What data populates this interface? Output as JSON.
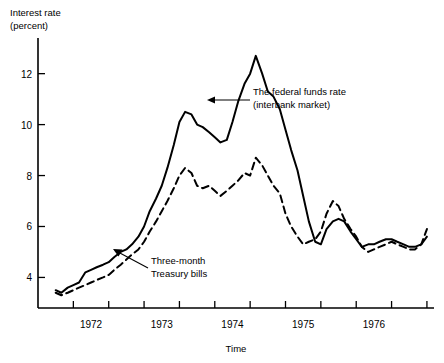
{
  "chart_data": {
    "type": "line",
    "title": "",
    "ylabel": "Interest rate (percent)",
    "ylabel_line1": "Interest rate",
    "ylabel_line2": "(percent)",
    "xlabel": "Time",
    "ylim": [
      2.8,
      13.4
    ],
    "xlim": [
      1971.5,
      1977.1
    ],
    "ytick_labels": [
      "4",
      "6",
      "8",
      "10",
      "12"
    ],
    "yticks": [
      4,
      6,
      8,
      10,
      12
    ],
    "xtick_labels": [
      "1972",
      "1973",
      "1974",
      "1975",
      "1976"
    ],
    "xticks": [
      1972.0,
      1972.5,
      1973.0,
      1973.5,
      1974.0,
      1974.5,
      1975.0,
      1975.5,
      1976.0,
      1976.5,
      1977.0
    ],
    "grid": false,
    "legend_position": "inline-annotations",
    "annotations": [
      {
        "name": "federal-funds-annotation",
        "line1": "The federal funds rate",
        "line2": "(interbank market)",
        "arrow": "left"
      },
      {
        "name": "treasury-bills-annotation",
        "line1": "Three-month",
        "line2": "Treasury bills",
        "arrow": "upper-left"
      }
    ],
    "series": [
      {
        "name": "The federal funds rate (interbank market)",
        "style": "solid",
        "color": "#000000",
        "x": [
          1971.75,
          1971.83,
          1971.92,
          1972.0,
          1972.08,
          1972.17,
          1972.25,
          1972.33,
          1972.42,
          1972.5,
          1972.58,
          1972.67,
          1972.75,
          1972.83,
          1972.92,
          1973.0,
          1973.08,
          1973.17,
          1973.25,
          1973.33,
          1973.42,
          1973.5,
          1973.58,
          1973.67,
          1973.75,
          1973.83,
          1973.92,
          1974.0,
          1974.08,
          1974.17,
          1974.25,
          1974.33,
          1974.42,
          1974.5,
          1974.58,
          1974.67,
          1974.75,
          1974.83,
          1974.92,
          1975.0,
          1975.08,
          1975.17,
          1975.25,
          1975.33,
          1975.42,
          1975.5,
          1975.58,
          1975.67,
          1975.75,
          1975.83,
          1975.92,
          1976.0,
          1976.08,
          1976.17,
          1976.25,
          1976.33,
          1976.42,
          1976.5,
          1976.58,
          1976.67,
          1976.75,
          1976.83,
          1976.92,
          1977.0
        ],
        "y": [
          3.5,
          3.4,
          3.6,
          3.7,
          3.8,
          4.2,
          4.3,
          4.4,
          4.5,
          4.6,
          4.8,
          5.0,
          5.1,
          5.3,
          5.6,
          6.0,
          6.6,
          7.1,
          7.6,
          8.3,
          9.2,
          10.1,
          10.5,
          10.4,
          10.0,
          9.9,
          9.7,
          9.5,
          9.3,
          9.4,
          10.1,
          10.9,
          11.6,
          12.0,
          12.7,
          12.0,
          11.3,
          11.1,
          10.6,
          9.8,
          9.0,
          8.2,
          7.2,
          6.2,
          5.4,
          5.3,
          5.9,
          6.2,
          6.3,
          6.2,
          5.8,
          5.5,
          5.2,
          5.3,
          5.3,
          5.4,
          5.5,
          5.5,
          5.4,
          5.3,
          5.2,
          5.2,
          5.3,
          5.6
        ]
      },
      {
        "name": "Three-month Treasury bills",
        "style": "dashed",
        "color": "#000000",
        "x": [
          1971.75,
          1971.83,
          1971.92,
          1972.0,
          1972.08,
          1972.17,
          1972.25,
          1972.33,
          1972.42,
          1972.5,
          1972.58,
          1972.67,
          1972.75,
          1972.83,
          1972.92,
          1973.0,
          1973.08,
          1973.17,
          1973.25,
          1973.33,
          1973.42,
          1973.5,
          1973.58,
          1973.67,
          1973.75,
          1973.83,
          1973.92,
          1974.0,
          1974.08,
          1974.17,
          1974.25,
          1974.33,
          1974.42,
          1974.5,
          1974.58,
          1974.67,
          1974.75,
          1974.83,
          1974.92,
          1975.0,
          1975.08,
          1975.17,
          1975.25,
          1975.33,
          1975.42,
          1975.5,
          1975.58,
          1975.67,
          1975.75,
          1975.83,
          1975.92,
          1976.0,
          1976.08,
          1976.17,
          1976.25,
          1976.33,
          1976.42,
          1976.5,
          1976.58,
          1976.67,
          1976.75,
          1976.83,
          1976.92,
          1977.0
        ],
        "y": [
          3.4,
          3.3,
          3.4,
          3.5,
          3.6,
          3.7,
          3.8,
          3.9,
          4.0,
          4.1,
          4.3,
          4.5,
          4.7,
          4.9,
          5.1,
          5.4,
          5.8,
          6.2,
          6.6,
          7.0,
          7.5,
          8.0,
          8.3,
          8.1,
          7.6,
          7.5,
          7.6,
          7.4,
          7.2,
          7.4,
          7.6,
          7.8,
          8.1,
          8.0,
          8.7,
          8.4,
          8.0,
          7.6,
          7.3,
          6.5,
          6.0,
          5.6,
          5.3,
          5.4,
          5.5,
          5.8,
          6.5,
          7.0,
          6.8,
          6.3,
          5.9,
          5.6,
          5.2,
          5.0,
          5.1,
          5.2,
          5.3,
          5.4,
          5.3,
          5.2,
          5.1,
          5.1,
          5.3,
          5.9
        ]
      }
    ]
  }
}
